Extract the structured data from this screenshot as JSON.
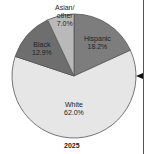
{
  "chart_data": {
    "type": "pie",
    "title": "2025",
    "slices": [
      {
        "label": "Hispanic",
        "value": 18.2,
        "display": "18.2%",
        "color": "#7d7d7d"
      },
      {
        "label": "White",
        "value": 62.0,
        "display": "62.0%",
        "color": "#e6e6e6"
      },
      {
        "label": "Black",
        "value": 12.9,
        "display": "12.9%",
        "color": "#6e6e6e"
      },
      {
        "label": "Asian/ other",
        "value": 7.0,
        "display": "7.0%",
        "color": "#b9b9b9"
      }
    ],
    "start_angle": "Hispanic begins at 12 o'clock, clockwise",
    "legend": "none (inline labels)"
  },
  "labels": {
    "hispanic": {
      "name": "Hispanic",
      "pct": "18.2%"
    },
    "white": {
      "name": "White",
      "pct": "62.0%"
    },
    "black": {
      "name": "Black",
      "pct": "12.9%"
    },
    "asian": {
      "name1": "Asian/",
      "name2": "other",
      "pct": "7.0%"
    }
  },
  "year": "2025"
}
